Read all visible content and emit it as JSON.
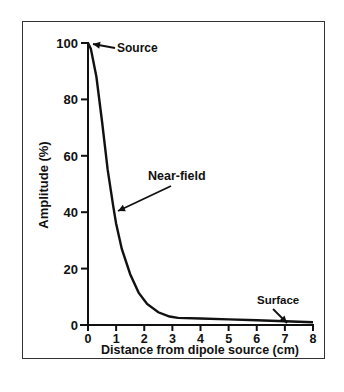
{
  "chart_data": {
    "type": "line",
    "title": "",
    "xlabel": "Distance from dipole source (cm)",
    "ylabel": "Amplitude (%)",
    "xlim": [
      0,
      8
    ],
    "ylim": [
      0,
      100
    ],
    "xticks": [
      "0",
      "1",
      "2",
      "3",
      "4",
      "5",
      "6",
      "7",
      "8"
    ],
    "yticks": [
      "0",
      "20",
      "40",
      "60",
      "80",
      "100"
    ],
    "grid": false,
    "series": [
      {
        "name": "Amplitude",
        "x": [
          0,
          0.1,
          0.3,
          0.5,
          0.7,
          0.9,
          1.0,
          1.2,
          1.5,
          1.8,
          2.1,
          2.5,
          2.9,
          3.2,
          4,
          5,
          6,
          7,
          8
        ],
        "y": [
          100,
          98,
          88,
          72,
          55,
          42,
          36,
          27,
          18,
          11.5,
          7.5,
          4.5,
          3,
          2.5,
          2.3,
          2,
          1.7,
          1.3,
          1
        ]
      }
    ],
    "annotations": [
      {
        "text": "Source",
        "x": 0,
        "y": 100
      },
      {
        "text": "Near-field",
        "x": 1.0,
        "y": 40
      },
      {
        "text": "Surface",
        "x": 7.0,
        "y": 1.5
      }
    ]
  }
}
